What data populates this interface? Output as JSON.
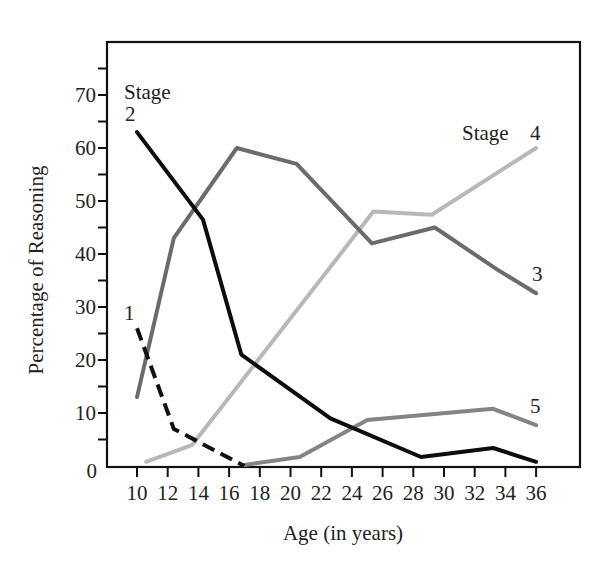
{
  "chart_data": {
    "type": "line",
    "title": "",
    "xlabel": "Age (in years)",
    "ylabel": "Percentage of Reasoning",
    "xlim": [
      9,
      38
    ],
    "ylim": [
      0,
      78
    ],
    "x_ticks": [
      10,
      12,
      14,
      16,
      18,
      20,
      22,
      24,
      26,
      28,
      30,
      32,
      34,
      36
    ],
    "y_ticks_labeled": [
      0,
      10,
      20,
      30,
      40,
      50,
      60,
      70
    ],
    "y_ticks_minor": [
      5,
      15,
      25,
      35,
      45,
      55,
      65,
      75
    ],
    "grid": false,
    "legend": "inline labels",
    "series": [
      {
        "name": "Stage 1",
        "label": "1",
        "color": "#111111",
        "dash": true,
        "x": [
          10,
          12.4,
          17
        ],
        "values": [
          26,
          7,
          0
        ]
      },
      {
        "name": "Stage 2",
        "label": "2",
        "color": "#0d0d0d",
        "dash": false,
        "x": [
          10,
          14.3,
          16.8,
          22.6,
          28.5,
          33.2,
          36
        ],
        "values": [
          63,
          46.5,
          21,
          9,
          1.7,
          3.4,
          0.8
        ]
      },
      {
        "name": "Stage 3",
        "label": "3",
        "color": "#6b6b6b",
        "dash": false,
        "x": [
          10,
          12.4,
          16.5,
          20.4,
          25.3,
          29.4,
          33.5,
          36
        ],
        "values": [
          13,
          43,
          60,
          57,
          42,
          45,
          37,
          32.6
        ]
      },
      {
        "name": "Stage 4",
        "label": "4",
        "color": "#b8b8b8",
        "dash": false,
        "x": [
          10.6,
          13.6,
          25.4,
          29.2,
          36
        ],
        "values": [
          0.8,
          4,
          48,
          47.4,
          60
        ]
      },
      {
        "name": "Stage 5",
        "label": "5",
        "color": "#848484",
        "dash": false,
        "x": [
          17,
          20.6,
          25,
          33.2,
          36
        ],
        "values": [
          0.2,
          1.7,
          8.7,
          10.8,
          7.7
        ]
      }
    ],
    "annotations": [
      {
        "text": "Stage",
        "near": "Stage 2 start"
      },
      {
        "text": "2",
        "near": "Stage 2 start"
      },
      {
        "text": "1",
        "near": "Stage 1 start"
      },
      {
        "text": "Stage",
        "near": "Stage 4 end"
      },
      {
        "text": "4",
        "near": "Stage 4 end"
      },
      {
        "text": "3",
        "near": "Stage 3 end"
      },
      {
        "text": "5",
        "near": "Stage 5 end"
      }
    ]
  },
  "labels": {
    "stage_word_left": "Stage",
    "stage2_num": "2",
    "stage1_num": "1",
    "stage_word_right": "Stage",
    "stage4_num": "4",
    "stage3_num": "3",
    "stage5_num": "5",
    "xlabel": "Age (in years)",
    "ylabel": "Percentage of Reasoning"
  }
}
